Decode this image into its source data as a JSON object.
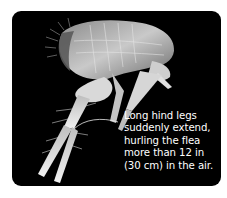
{
  "figure": {
    "subject": "flea",
    "background_color": "#000000",
    "page_color": "#ffffff",
    "caption": {
      "lines": [
        "Long hind legs",
        "suddenly extend,",
        "hurling the flea",
        "more than 12 in",
        "(30 cm) in the air."
      ]
    },
    "leader_line_color": "#e8e8e8"
  }
}
